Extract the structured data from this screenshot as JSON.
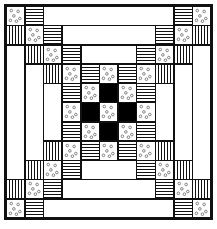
{
  "grid": {
    "cols": 11,
    "rows": 11
  },
  "colors": {
    "ink": "#111111",
    "fill_dark": "#000000",
    "background": "#ffffff"
  },
  "fabric_legend": {
    "dot": "dotted print",
    "hstripe": "horizontal stripes",
    "vstripe": "vertical stripes",
    "black": "solid black",
    "white": "plain white"
  },
  "pieces": [
    {
      "r": 0,
      "c": 0,
      "w": 1,
      "h": 1,
      "t": "dot"
    },
    {
      "r": 0,
      "c": 1,
      "w": 1,
      "h": 1,
      "t": "hstripe"
    },
    {
      "r": 0,
      "c": 2,
      "w": 7,
      "h": 1,
      "t": "white"
    },
    {
      "r": 0,
      "c": 9,
      "w": 1,
      "h": 1,
      "t": "hstripe"
    },
    {
      "r": 0,
      "c": 10,
      "w": 1,
      "h": 1,
      "t": "dot"
    },
    {
      "r": 1,
      "c": 0,
      "w": 1,
      "h": 1,
      "t": "vstripe"
    },
    {
      "r": 1,
      "c": 1,
      "w": 1,
      "h": 1,
      "t": "dot"
    },
    {
      "r": 1,
      "c": 2,
      "w": 1,
      "h": 1,
      "t": "hstripe"
    },
    {
      "r": 1,
      "c": 3,
      "w": 5,
      "h": 1,
      "t": "white"
    },
    {
      "r": 1,
      "c": 8,
      "w": 1,
      "h": 1,
      "t": "hstripe"
    },
    {
      "r": 1,
      "c": 9,
      "w": 1,
      "h": 1,
      "t": "dot"
    },
    {
      "r": 1,
      "c": 10,
      "w": 1,
      "h": 1,
      "t": "vstripe"
    },
    {
      "r": 2,
      "c": 0,
      "w": 1,
      "h": 7,
      "t": "white"
    },
    {
      "r": 2,
      "c": 1,
      "w": 1,
      "h": 1,
      "t": "vstripe"
    },
    {
      "r": 2,
      "c": 2,
      "w": 1,
      "h": 1,
      "t": "dot"
    },
    {
      "r": 2,
      "c": 3,
      "w": 1,
      "h": 1,
      "t": "hstripe"
    },
    {
      "r": 2,
      "c": 4,
      "w": 3,
      "h": 1,
      "t": "white"
    },
    {
      "r": 2,
      "c": 7,
      "w": 1,
      "h": 1,
      "t": "hstripe"
    },
    {
      "r": 2,
      "c": 8,
      "w": 1,
      "h": 1,
      "t": "dot"
    },
    {
      "r": 2,
      "c": 9,
      "w": 1,
      "h": 1,
      "t": "vstripe"
    },
    {
      "r": 2,
      "c": 10,
      "w": 1,
      "h": 7,
      "t": "white"
    },
    {
      "r": 3,
      "c": 1,
      "w": 1,
      "h": 5,
      "t": "white"
    },
    {
      "r": 3,
      "c": 2,
      "w": 1,
      "h": 1,
      "t": "vstripe"
    },
    {
      "r": 3,
      "c": 3,
      "w": 1,
      "h": 1,
      "t": "dot"
    },
    {
      "r": 3,
      "c": 4,
      "w": 1,
      "h": 1,
      "t": "hstripe"
    },
    {
      "r": 3,
      "c": 5,
      "w": 1,
      "h": 1,
      "t": "dot"
    },
    {
      "r": 3,
      "c": 6,
      "w": 1,
      "h": 1,
      "t": "hstripe"
    },
    {
      "r": 3,
      "c": 7,
      "w": 1,
      "h": 1,
      "t": "dot"
    },
    {
      "r": 3,
      "c": 8,
      "w": 1,
      "h": 1,
      "t": "vstripe"
    },
    {
      "r": 3,
      "c": 9,
      "w": 1,
      "h": 5,
      "t": "white"
    },
    {
      "r": 4,
      "c": 2,
      "w": 1,
      "h": 3,
      "t": "white"
    },
    {
      "r": 4,
      "c": 3,
      "w": 1,
      "h": 1,
      "t": "hstripe"
    },
    {
      "r": 4,
      "c": 4,
      "w": 1,
      "h": 1,
      "t": "dot"
    },
    {
      "r": 4,
      "c": 5,
      "w": 1,
      "h": 1,
      "t": "black"
    },
    {
      "r": 4,
      "c": 6,
      "w": 1,
      "h": 1,
      "t": "dot"
    },
    {
      "r": 4,
      "c": 7,
      "w": 1,
      "h": 1,
      "t": "hstripe"
    },
    {
      "r": 4,
      "c": 8,
      "w": 1,
      "h": 3,
      "t": "white"
    },
    {
      "r": 5,
      "c": 3,
      "w": 1,
      "h": 1,
      "t": "dot"
    },
    {
      "r": 5,
      "c": 4,
      "w": 1,
      "h": 1,
      "t": "black"
    },
    {
      "r": 5,
      "c": 5,
      "w": 1,
      "h": 1,
      "t": "dot"
    },
    {
      "r": 5,
      "c": 6,
      "w": 1,
      "h": 1,
      "t": "black"
    },
    {
      "r": 5,
      "c": 7,
      "w": 1,
      "h": 1,
      "t": "dot"
    },
    {
      "r": 6,
      "c": 3,
      "w": 1,
      "h": 1,
      "t": "hstripe"
    },
    {
      "r": 6,
      "c": 4,
      "w": 1,
      "h": 1,
      "t": "dot"
    },
    {
      "r": 6,
      "c": 5,
      "w": 1,
      "h": 1,
      "t": "black"
    },
    {
      "r": 6,
      "c": 6,
      "w": 1,
      "h": 1,
      "t": "dot"
    },
    {
      "r": 6,
      "c": 7,
      "w": 1,
      "h": 1,
      "t": "hstripe"
    },
    {
      "r": 7,
      "c": 2,
      "w": 1,
      "h": 1,
      "t": "vstripe"
    },
    {
      "r": 7,
      "c": 3,
      "w": 1,
      "h": 1,
      "t": "dot"
    },
    {
      "r": 7,
      "c": 4,
      "w": 1,
      "h": 1,
      "t": "hstripe"
    },
    {
      "r": 7,
      "c": 5,
      "w": 1,
      "h": 1,
      "t": "dot"
    },
    {
      "r": 7,
      "c": 6,
      "w": 1,
      "h": 1,
      "t": "hstripe"
    },
    {
      "r": 7,
      "c": 7,
      "w": 1,
      "h": 1,
      "t": "dot"
    },
    {
      "r": 7,
      "c": 8,
      "w": 1,
      "h": 1,
      "t": "vstripe"
    },
    {
      "r": 8,
      "c": 1,
      "w": 1,
      "h": 1,
      "t": "vstripe"
    },
    {
      "r": 8,
      "c": 2,
      "w": 1,
      "h": 1,
      "t": "dot"
    },
    {
      "r": 8,
      "c": 3,
      "w": 1,
      "h": 1,
      "t": "hstripe"
    },
    {
      "r": 8,
      "c": 4,
      "w": 3,
      "h": 1,
      "t": "white"
    },
    {
      "r": 8,
      "c": 7,
      "w": 1,
      "h": 1,
      "t": "hstripe"
    },
    {
      "r": 8,
      "c": 8,
      "w": 1,
      "h": 1,
      "t": "dot"
    },
    {
      "r": 8,
      "c": 9,
      "w": 1,
      "h": 1,
      "t": "vstripe"
    },
    {
      "r": 9,
      "c": 0,
      "w": 1,
      "h": 1,
      "t": "vstripe"
    },
    {
      "r": 9,
      "c": 1,
      "w": 1,
      "h": 1,
      "t": "dot"
    },
    {
      "r": 9,
      "c": 2,
      "w": 1,
      "h": 1,
      "t": "hstripe"
    },
    {
      "r": 9,
      "c": 3,
      "w": 5,
      "h": 1,
      "t": "white"
    },
    {
      "r": 9,
      "c": 8,
      "w": 1,
      "h": 1,
      "t": "hstripe"
    },
    {
      "r": 9,
      "c": 9,
      "w": 1,
      "h": 1,
      "t": "dot"
    },
    {
      "r": 9,
      "c": 10,
      "w": 1,
      "h": 1,
      "t": "vstripe"
    },
    {
      "r": 10,
      "c": 0,
      "w": 1,
      "h": 1,
      "t": "dot"
    },
    {
      "r": 10,
      "c": 1,
      "w": 1,
      "h": 1,
      "t": "hstripe"
    },
    {
      "r": 10,
      "c": 2,
      "w": 7,
      "h": 1,
      "t": "white"
    },
    {
      "r": 10,
      "c": 9,
      "w": 1,
      "h": 1,
      "t": "hstripe"
    },
    {
      "r": 10,
      "c": 10,
      "w": 1,
      "h": 1,
      "t": "dot"
    }
  ]
}
